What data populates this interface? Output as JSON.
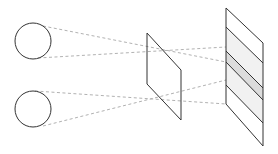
{
  "diagram": {
    "title": "",
    "colors": {
      "stroke": "#333333",
      "projection_line": "#a8a8a8",
      "shade_light": "#f1f1f1",
      "shade_dark": "#dcdcdc",
      "background": "#ffffff"
    },
    "elements": {
      "sources": [
        {
          "id": "source-top",
          "shape": "circle"
        },
        {
          "id": "source-bottom",
          "shape": "circle"
        }
      ],
      "aperture": {
        "id": "aperture-plane",
        "shape": "parallelogram"
      },
      "screen": {
        "id": "screen-plane",
        "shape": "parallelogram",
        "stripe_count": 6,
        "shaded_band": "light gray band with darker center band"
      }
    },
    "labels": []
  }
}
